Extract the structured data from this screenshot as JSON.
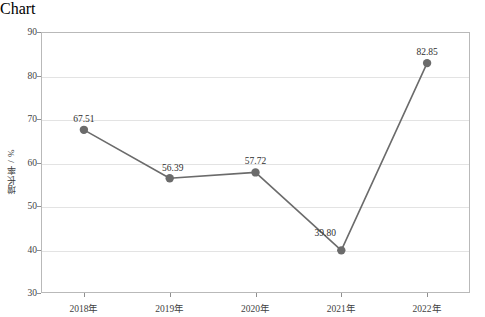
{
  "chart_data": {
    "type": "line",
    "title": "",
    "xlabel": "",
    "ylabel": "增长率 / %",
    "categories": [
      "2018年",
      "2019年",
      "2020年",
      "2021年",
      "2022年"
    ],
    "values": [
      67.51,
      56.39,
      57.72,
      39.8,
      82.85
    ],
    "point_labels": [
      "67.51",
      "56.39",
      "57.72",
      "39.80",
      "82.85"
    ],
    "ylim": [
      30,
      90
    ],
    "yticks": [
      30,
      40,
      50,
      60,
      70,
      80,
      90
    ],
    "ytick_labels": [
      "30",
      "40",
      "50",
      "60",
      "70",
      "80",
      "90"
    ],
    "grid": true,
    "legend": false,
    "series": [
      {
        "name": "增长率",
        "values": [
          67.51,
          56.39,
          57.72,
          39.8,
          82.85
        ],
        "color": "#6b6b6b",
        "marker": "circle"
      }
    ]
  },
  "style": {
    "line_color": "#6b6b6b",
    "marker_color": "#6b6b6b",
    "gridline_color": "#e3e3e3",
    "axis_color": "#b9b9b9",
    "tick_color": "#8f8f8f",
    "text_color": "#3f3f3f",
    "background": "#ffffff"
  }
}
